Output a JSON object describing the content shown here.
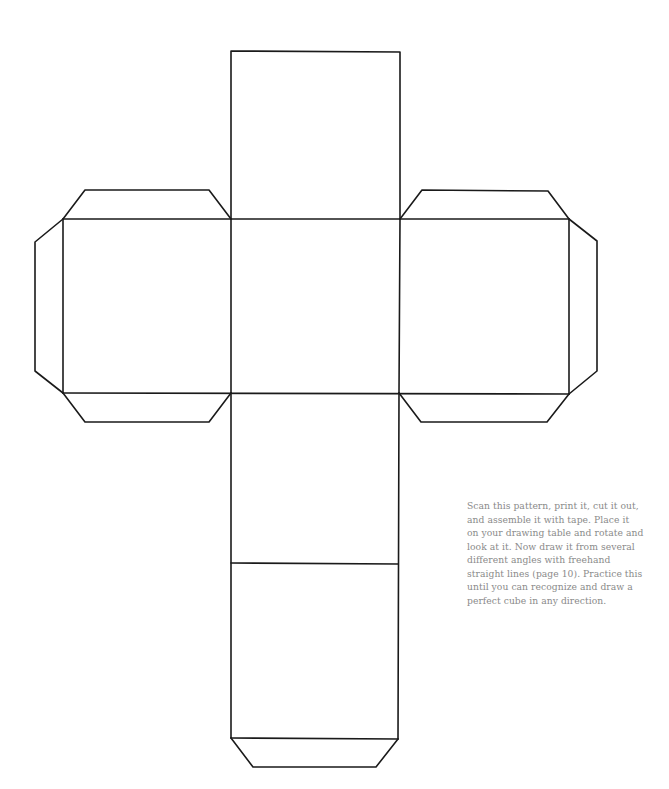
{
  "figure": {
    "stroke_color": "#1a1a1a",
    "background": "#ffffff"
  },
  "caption": {
    "color": "#8a8a8a",
    "lines": [
      "Scan this pattern, print it, cut it out,",
      "and assemble it with tape. Place it",
      "on your drawing table and rotate and",
      "look at it. Now draw it from several",
      "different angles with freehand",
      "straight lines (page 10). Practice this",
      "until you can recognize and draw a",
      "perfect cube in any direction."
    ]
  }
}
